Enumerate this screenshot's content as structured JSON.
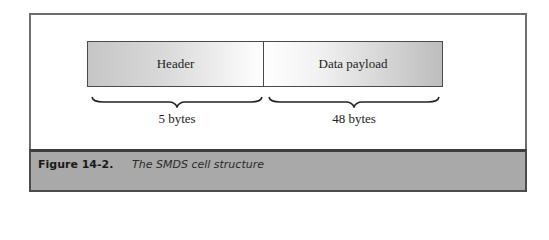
{
  "diagram": {
    "cells": [
      {
        "label": "Header",
        "size": "5 bytes"
      },
      {
        "label": "Data payload",
        "size": "48 bytes"
      }
    ]
  },
  "caption": {
    "number": "Figure 14-2.",
    "title": "The SMDS cell structure"
  }
}
